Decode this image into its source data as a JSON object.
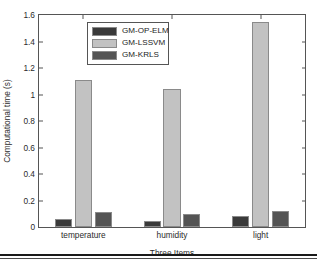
{
  "chart_data": {
    "type": "bar",
    "title": "",
    "subtitle": "",
    "xlabel": "Three Items",
    "ylabel": "Computational time (s)",
    "categories": [
      "temperature",
      "humidity",
      "light"
    ],
    "series": [
      {
        "name": "GM-OP-ELM",
        "color": "#3a3a3a",
        "values": [
          0.06,
          0.045,
          0.08
        ]
      },
      {
        "name": "GM-LSSVM",
        "color": "#c2c2c2",
        "values": [
          1.11,
          1.04,
          1.545
        ]
      },
      {
        "name": "GM-KRLS",
        "color": "#545454",
        "values": [
          0.11,
          0.095,
          0.12
        ]
      }
    ],
    "ylim": [
      0,
      1.6
    ],
    "ytick_values": [
      0,
      0.2,
      0.4,
      0.6,
      0.8,
      1,
      1.2,
      1.4,
      1.6
    ],
    "ytick_labels": [
      "0",
      "0.2",
      "0.4",
      "0.6",
      "0.8",
      "1",
      "1.2",
      "1.4",
      "1.6"
    ],
    "grid": false,
    "legend_position": "top-center",
    "axis_color": "#555555",
    "background": "#ffffff"
  }
}
